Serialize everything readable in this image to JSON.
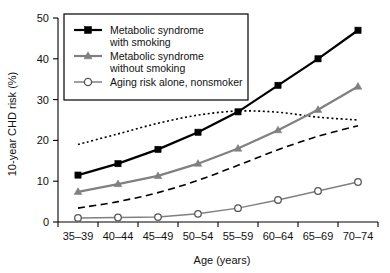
{
  "chart_data": {
    "type": "line",
    "title": "",
    "xlabel": "Age (years)",
    "ylabel": "10-year CHD risk (%)",
    "categories": [
      "35–39",
      "40–44",
      "45–49",
      "50–54",
      "55–59",
      "60–64",
      "65–69",
      "70–74"
    ],
    "ylim": [
      0,
      50
    ],
    "yticks": [
      0,
      10,
      20,
      30,
      40,
      50
    ],
    "ytick_labels": [
      "0",
      "10",
      "20",
      "30",
      "40",
      "50"
    ],
    "grid": false,
    "legend_position": "top-left-inside",
    "series": [
      {
        "name": "Metabolic syndrome with smoking",
        "marker": "filled-square",
        "line_style": "solid",
        "color": "#000000",
        "values": [
          11.5,
          14.3,
          17.8,
          22.0,
          27.0,
          33.5,
          40.0,
          47.0
        ]
      },
      {
        "name": "Metabolic syndrome without smoking",
        "marker": "filled-triangle",
        "line_style": "solid",
        "color": "#808080",
        "values": [
          7.4,
          9.3,
          11.3,
          14.3,
          18.0,
          22.5,
          27.5,
          33.2
        ]
      },
      {
        "name": "Aging risk alone, nonsmoker",
        "marker": "open-circle",
        "line_style": "solid",
        "color": "#808080",
        "values": [
          1.0,
          1.1,
          1.2,
          2.0,
          3.4,
          5.4,
          7.6,
          9.8
        ]
      },
      {
        "name": "unlabeled dotted curve",
        "marker": "none",
        "line_style": "dotted",
        "color": "#000000",
        "values": [
          19.0,
          21.6,
          24.2,
          26.2,
          27.2,
          26.9,
          25.7,
          25.0
        ]
      },
      {
        "name": "unlabeled dashed curve",
        "marker": "none",
        "line_style": "dashed",
        "color": "#000000",
        "values": [
          3.4,
          5.0,
          7.2,
          10.2,
          13.9,
          17.7,
          21.0,
          23.6
        ]
      }
    ]
  },
  "legend": {
    "entries": [
      {
        "line1": "Metabolic syndrome",
        "line2": "with smoking"
      },
      {
        "line1": "Metabolic syndrome",
        "line2": "without smoking"
      },
      {
        "line1": "Aging risk alone, nonsmoker",
        "line2": ""
      }
    ]
  },
  "colors": {
    "black": "#000000",
    "gray": "#808080",
    "background": "#ffffff"
  }
}
